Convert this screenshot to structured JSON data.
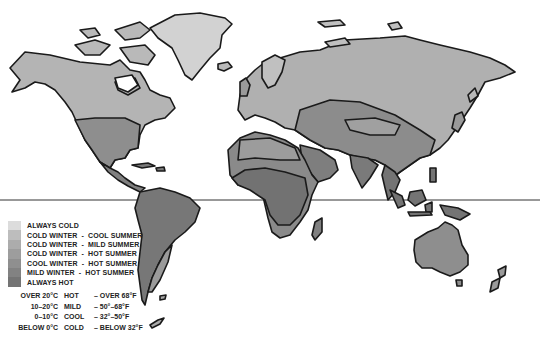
{
  "map": {
    "title": "World climate zones",
    "equator_label": "",
    "colors": {
      "always_cold": "#dcdcdc",
      "cold_cool": "#b9b9b9",
      "cold_mild": "#a9a9a9",
      "cold_hot": "#9b9b9b",
      "cool_hot": "#8c8c8c",
      "mild_hot": "#7f7f7f",
      "always_hot": "#727272",
      "coastline": "#1a1a1a"
    }
  },
  "legend": {
    "items": [
      {
        "label": "ALWAYS COLD",
        "color": "#dcdcdc"
      },
      {
        "label": "COLD WINTER  -  COOL SUMMER",
        "color": "#bdbdbd"
      },
      {
        "label": "COLD WINTER  -  MILD SUMMER",
        "color": "#acacac"
      },
      {
        "label": "COLD WINTER  -  HOT SUMMER",
        "color": "#9d9d9d"
      },
      {
        "label": "COOL WINTER  -  HOT SUMMER",
        "color": "#8f8f8f"
      },
      {
        "label": "MILD WINTER  -  HOT SUMMER",
        "color": "#828282"
      },
      {
        "label": "ALWAYS HOT",
        "color": "#747474"
      }
    ]
  },
  "temperature_key": [
    {
      "celsius": "OVER 20°C",
      "name": "HOT",
      "fahrenheit": "– OVER 68°F"
    },
    {
      "celsius": "10–20°C",
      "name": "MILD",
      "fahrenheit": "– 50°–68°F"
    },
    {
      "celsius": "0–10°C",
      "name": "COOL",
      "fahrenheit": "– 32°–50°F"
    },
    {
      "celsius": "BELOW 0°C",
      "name": "COLD",
      "fahrenheit": "– BELOW 32°F"
    }
  ]
}
